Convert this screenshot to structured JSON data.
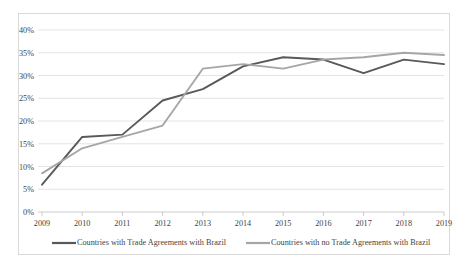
{
  "chart_data": {
    "type": "line",
    "title": "",
    "xlabel": "",
    "ylabel": "",
    "categories": [
      "2009",
      "2010",
      "2011",
      "2012",
      "2013",
      "2014",
      "2015",
      "2016",
      "2017",
      "2018",
      "2019"
    ],
    "ylim": [
      0,
      40
    ],
    "ytick_values": [
      0,
      5,
      10,
      15,
      20,
      25,
      30,
      35,
      40
    ],
    "ytick_labels": [
      "0%",
      "5%",
      "10%",
      "15%",
      "20%",
      "25%",
      "30%",
      "35%",
      "40%"
    ],
    "grid": true,
    "legend_position": "bottom",
    "value_unit": "%",
    "series": [
      {
        "name": "Countries with Trade Agreements with Brazil",
        "color": "#595959",
        "values": [
          6.0,
          16.5,
          17.0,
          24.5,
          27.0,
          32.0,
          34.0,
          33.5,
          30.5,
          33.5,
          32.5
        ]
      },
      {
        "name": "Countries with no Trade Agreements with Brazil",
        "color": "#a6a6a6",
        "values": [
          8.5,
          14.0,
          16.5,
          19.0,
          31.5,
          32.5,
          31.5,
          33.5,
          34.0,
          35.0,
          34.5
        ]
      }
    ]
  },
  "legend": {
    "items": [
      {
        "label": "Countries with Trade Agreements with Brazil",
        "color": "#595959"
      },
      {
        "label": "Countries with no Trade Agreements with Brazil",
        "color": "#a6a6a6"
      }
    ]
  },
  "colors": {
    "series_dark": "#595959",
    "series_light": "#a6a6a6",
    "gridline": "#d9d9d9",
    "frame_border": "#d9d9d9",
    "text": "#3f3f3f",
    "background": "#ffffff"
  }
}
